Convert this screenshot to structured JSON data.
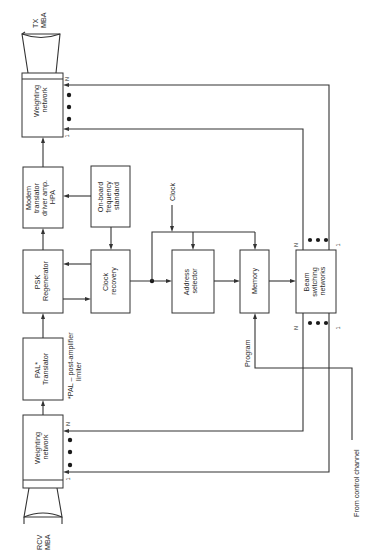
{
  "diagram": {
    "orientation": "rotated-90-ccw",
    "antennas": {
      "tx": {
        "line1": "TX",
        "line2": "MBA"
      },
      "rcv": {
        "line1": "RCV",
        "line2": "MBA"
      }
    },
    "blocks": {
      "tx_weighting": {
        "line1": "Weighting",
        "line2": "network"
      },
      "modem": {
        "line1": "Modem",
        "line2": "translator",
        "line3": "driver amp.",
        "line4": "HPA"
      },
      "freq_standard": {
        "line1": "On-board",
        "line2": "frequency",
        "line3": "standard"
      },
      "psk": {
        "line1": "PSK",
        "line2": "Regenerator"
      },
      "clock_recovery": {
        "line1": "Clock",
        "line2": "recovery"
      },
      "pal": {
        "line1": "PAL*",
        "line2": "Translator"
      },
      "rcv_weighting": {
        "line1": "Weighting",
        "line2": "network"
      },
      "address_selector": {
        "line1": "Address",
        "line2": "selector"
      },
      "memory": {
        "line1": "Memory"
      },
      "beam_switching": {
        "line1": "Beam",
        "line2": "switching",
        "line3": "networks"
      }
    },
    "labels": {
      "clock": "Clock",
      "program": "Program",
      "control_channel": "From control channel",
      "footnote_line1": "*PAL – post-amplifier",
      "footnote_line2": "limiter",
      "port_n": "N",
      "port_1": "1"
    }
  }
}
